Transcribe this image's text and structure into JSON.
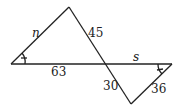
{
  "diagram": {
    "type": "similar-triangles",
    "triangles": [
      {
        "name": "left-triangle",
        "vertices": [
          [
            11,
            64
          ],
          [
            69,
            7
          ],
          [
            105,
            64
          ]
        ]
      },
      {
        "name": "right-triangle",
        "vertices": [
          [
            105,
            64
          ],
          [
            172,
            64
          ],
          [
            131,
            104
          ]
        ]
      }
    ],
    "labels": {
      "n": "n",
      "side_45": "45",
      "side_63": "63",
      "s": "s",
      "side_30": "30",
      "side_36": "36"
    },
    "line_color": "#222222"
  }
}
